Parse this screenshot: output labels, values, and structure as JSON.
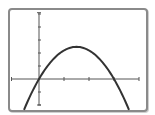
{
  "chart_data": {
    "type": "line",
    "title": "",
    "xlabel": "",
    "ylabel": "",
    "function": "y = -1.1x(x - 3)",
    "series": [
      {
        "name": "parabola",
        "x": [
          -0.6,
          -0.3,
          0,
          0.5,
          1.0,
          1.5,
          2.0,
          2.5,
          3.0,
          3.3,
          3.6
        ],
        "values": [
          -2.0,
          -1.09,
          0,
          1.38,
          2.2,
          2.48,
          2.2,
          1.38,
          0,
          -1.09,
          -2.0
        ]
      }
    ],
    "xlim": [
      -1.1,
      4.0
    ],
    "ylim": [
      -2.0,
      5.1
    ],
    "x_ticks": [
      1,
      2,
      3,
      4
    ],
    "y_ticks": [
      -2,
      -1,
      1,
      2,
      3,
      4,
      5
    ],
    "tick_labels_shown": false,
    "grid": false,
    "legend": null
  },
  "colors": {
    "frame": "#8a8a8a",
    "axis": "#555555",
    "curve": "#333333",
    "background": "#ffffff"
  },
  "layout": {
    "origin_px": [
      39,
      79
    ],
    "x_unit_px": 25,
    "y_unit_px": 13
  }
}
